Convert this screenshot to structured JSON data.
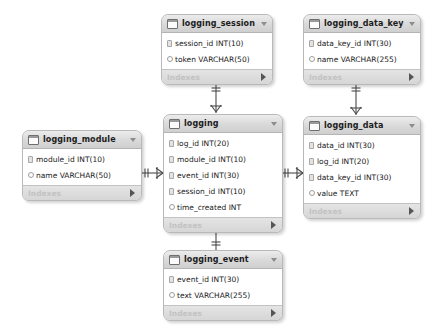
{
  "diagram": {
    "footer_label": "Indexes",
    "tables": [
      {
        "id": "logging_session",
        "name": "logging_session",
        "fields": [
          {
            "text": "session_id INT(10)",
            "marker": "pk"
          },
          {
            "text": "token VARCHAR(50)",
            "marker": "col"
          }
        ]
      },
      {
        "id": "logging_data_key",
        "name": "logging_data_key",
        "fields": [
          {
            "text": "data_key_id INT(30)",
            "marker": "pk"
          },
          {
            "text": "name VARCHAR(255)",
            "marker": "col"
          }
        ]
      },
      {
        "id": "logging",
        "name": "logging",
        "fields": [
          {
            "text": "log_id INT(20)",
            "marker": "pk"
          },
          {
            "text": "module_id INT(10)",
            "marker": "pk"
          },
          {
            "text": "event_id INT(30)",
            "marker": "pk"
          },
          {
            "text": "session_id INT(10)",
            "marker": "pk"
          },
          {
            "text": "time_created INT",
            "marker": "col"
          }
        ]
      },
      {
        "id": "logging_module",
        "name": "logging_module",
        "fields": [
          {
            "text": "module_id INT(10)",
            "marker": "pk"
          },
          {
            "text": "name VARCHAR(50)",
            "marker": "col"
          }
        ]
      },
      {
        "id": "logging_data",
        "name": "logging_data",
        "fields": [
          {
            "text": "data_id INT(30)",
            "marker": "pk"
          },
          {
            "text": "log_id INT(20)",
            "marker": "pk"
          },
          {
            "text": "data_key_id INT(30)",
            "marker": "pk"
          },
          {
            "text": "value TEXT",
            "marker": "col"
          }
        ]
      },
      {
        "id": "logging_event",
        "name": "logging_event",
        "fields": [
          {
            "text": "event_id INT(30)",
            "marker": "pk"
          },
          {
            "text": "text VARCHAR(255)",
            "marker": "col"
          }
        ]
      }
    ],
    "relationships": [
      {
        "id": "rel-module-logging",
        "from": "logging_module",
        "to": "logging",
        "from_card": "one",
        "to_card": "many"
      },
      {
        "id": "rel-logging-data",
        "from": "logging",
        "to": "logging_data",
        "from_card": "one",
        "to_card": "many"
      },
      {
        "id": "rel-session-logging",
        "from": "logging_session",
        "to": "logging",
        "from_card": "one",
        "to_card": "many"
      },
      {
        "id": "rel-datakey-data",
        "from": "logging_data_key",
        "to": "logging_data",
        "from_card": "one",
        "to_card": "many"
      },
      {
        "id": "rel-event-logging",
        "from": "logging_event",
        "to": "logging",
        "from_card": "one",
        "to_card": "many"
      }
    ]
  }
}
